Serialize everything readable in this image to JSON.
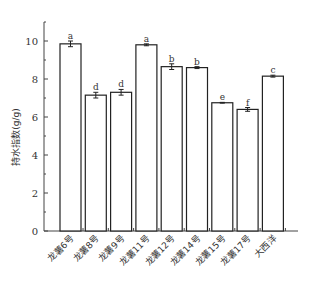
{
  "chart_data": {
    "type": "bar",
    "title": "",
    "xlabel": "",
    "ylabel": "持水指数(g/g)",
    "ylim": [
      0,
      11
    ],
    "yticks": [
      0,
      2,
      4,
      6,
      8,
      10
    ],
    "grid": false,
    "legend": null,
    "categories": [
      "龙薯6号",
      "龙薯8号",
      "龙薯9号",
      "龙薯11号",
      "龙薯12号",
      "龙薯14号",
      "龙薯15号",
      "龙薯17号",
      "大西洋"
    ],
    "values": [
      9.85,
      7.15,
      7.3,
      9.8,
      8.65,
      8.6,
      6.75,
      6.4,
      8.15
    ],
    "errors": [
      0.15,
      0.15,
      0.15,
      0.05,
      0.15,
      0.05,
      0.02,
      0.1,
      0.05
    ],
    "significance_letters": [
      "a",
      "d",
      "d",
      "a",
      "b",
      "b",
      "e",
      "f",
      "c"
    ]
  }
}
